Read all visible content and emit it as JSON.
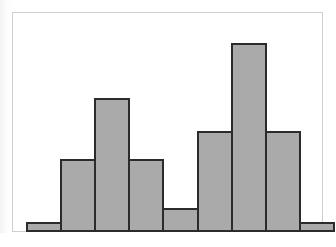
{
  "figure": {
    "name": "histogram-figure",
    "caption": "",
    "background_color": "#ffffff"
  },
  "plot": {
    "frame_border_color": "#cdcfd1",
    "plot_background_color": "#ffffff",
    "bar_fill_color": "#aaaaab",
    "bar_edge_color": "#2b2b2b",
    "axis_color": "#2b2b2b"
  },
  "chart_data": {
    "type": "bar",
    "title": "",
    "subtitle": "",
    "xlabel": "",
    "ylabel": "",
    "grid": false,
    "legend": false,
    "legend_position": "none",
    "axis_tick_labels_shown": false,
    "bin_count": 9,
    "categories": [
      "1",
      "2",
      "3",
      "4",
      "5",
      "6",
      "7",
      "8",
      "9"
    ],
    "values": [
      1,
      7.5,
      14,
      7.5,
      2.5,
      10.5,
      20,
      10.5,
      1
    ],
    "bar_pixel_heights": [
      10,
      72,
      133,
      72,
      24,
      101,
      189,
      101,
      10
    ],
    "ylim": [
      0,
      20
    ],
    "xlim": [
      0,
      9
    ],
    "annotations": [],
    "shape_description": "bimodal histogram with two peaks"
  },
  "bars": [
    {
      "label": "1",
      "value": 1,
      "height_pct": 5.0
    },
    {
      "label": "2",
      "value": 7.5,
      "height_pct": 37.5
    },
    {
      "label": "3",
      "value": 14,
      "height_pct": 69.0
    },
    {
      "label": "4",
      "value": 7.5,
      "height_pct": 37.5
    },
    {
      "label": "5",
      "value": 2.5,
      "height_pct": 12.5
    },
    {
      "label": "6",
      "value": 10.5,
      "height_pct": 52.0
    },
    {
      "label": "7",
      "value": 20,
      "height_pct": 97.5
    },
    {
      "label": "8",
      "value": 10.5,
      "height_pct": 52.0
    },
    {
      "label": "9",
      "value": 1,
      "height_pct": 5.0
    }
  ]
}
